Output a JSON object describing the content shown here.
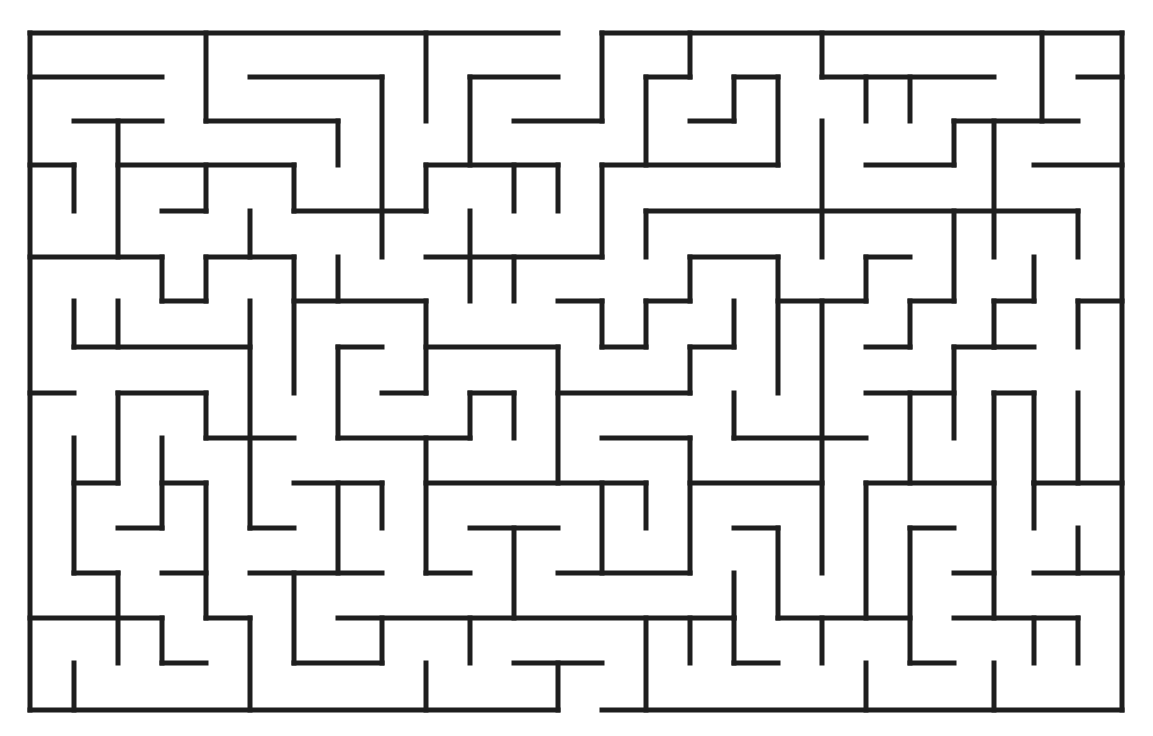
{
  "maze": {
    "title": "",
    "wall_color": "#1e1e1e",
    "background": "#ffffff",
    "entrance": {
      "x1": 558,
      "y1": 33,
      "x2": 602,
      "y2": 33
    },
    "exit": {
      "x1": 558,
      "y1": 710,
      "x2": 602,
      "y2": 710
    },
    "segments": [
      [
        30,
        33,
        558,
        33
      ],
      [
        602,
        33,
        1122,
        33
      ],
      [
        30,
        33,
        30,
        710
      ],
      [
        1122,
        33,
        1122,
        710
      ],
      [
        30,
        710,
        558,
        710
      ],
      [
        602,
        710,
        1122,
        710
      ],
      [
        30,
        77,
        162,
        77
      ],
      [
        206,
        33,
        206,
        121
      ],
      [
        206,
        121,
        338,
        121
      ],
      [
        338,
        121,
        338,
        165
      ],
      [
        250,
        77,
        382,
        77
      ],
      [
        382,
        77,
        382,
        257
      ],
      [
        426,
        33,
        426,
        121
      ],
      [
        470,
        77,
        558,
        77
      ],
      [
        470,
        77,
        470,
        165
      ],
      [
        514,
        121,
        602,
        121
      ],
      [
        602,
        33,
        602,
        121
      ],
      [
        646,
        77,
        690,
        77
      ],
      [
        690,
        33,
        690,
        77
      ],
      [
        646,
        77,
        646,
        165
      ],
      [
        734,
        77,
        778,
        77
      ],
      [
        734,
        77,
        734,
        121
      ],
      [
        690,
        121,
        734,
        121
      ],
      [
        778,
        77,
        778,
        165
      ],
      [
        602,
        165,
        778,
        165
      ],
      [
        822,
        33,
        822,
        77
      ],
      [
        822,
        77,
        994,
        77
      ],
      [
        866,
        77,
        866,
        121
      ],
      [
        910,
        77,
        910,
        121
      ],
      [
        1042,
        33,
        1042,
        121
      ],
      [
        1078,
        77,
        1122,
        77
      ],
      [
        74,
        121,
        162,
        121
      ],
      [
        118,
        121,
        118,
        257
      ],
      [
        118,
        165,
        294,
        165
      ],
      [
        294,
        165,
        294,
        211
      ],
      [
        294,
        211,
        426,
        211
      ],
      [
        30,
        165,
        74,
        165
      ],
      [
        74,
        165,
        74,
        211
      ],
      [
        162,
        211,
        206,
        211
      ],
      [
        206,
        165,
        206,
        211
      ],
      [
        250,
        211,
        250,
        257
      ],
      [
        426,
        165,
        558,
        165
      ],
      [
        426,
        165,
        426,
        211
      ],
      [
        514,
        165,
        514,
        211
      ],
      [
        558,
        165,
        558,
        211
      ],
      [
        470,
        211,
        470,
        301
      ],
      [
        426,
        257,
        602,
        257
      ],
      [
        514,
        257,
        514,
        301
      ],
      [
        602,
        165,
        602,
        257
      ],
      [
        646,
        211,
        1078,
        211
      ],
      [
        646,
        211,
        646,
        257
      ],
      [
        822,
        121,
        822,
        257
      ],
      [
        866,
        165,
        954,
        165
      ],
      [
        954,
        121,
        954,
        165
      ],
      [
        954,
        121,
        1078,
        121
      ],
      [
        994,
        121,
        994,
        257
      ],
      [
        1034,
        165,
        1122,
        165
      ],
      [
        1078,
        211,
        1078,
        257
      ],
      [
        30,
        257,
        162,
        257
      ],
      [
        162,
        257,
        162,
        301
      ],
      [
        162,
        301,
        206,
        301
      ],
      [
        206,
        257,
        206,
        301
      ],
      [
        206,
        257,
        294,
        257
      ],
      [
        294,
        257,
        294,
        393
      ],
      [
        338,
        257,
        338,
        301
      ],
      [
        294,
        301,
        426,
        301
      ],
      [
        426,
        301,
        426,
        393
      ],
      [
        382,
        393,
        426,
        393
      ],
      [
        338,
        347,
        382,
        347
      ],
      [
        338,
        347,
        338,
        438
      ],
      [
        338,
        438,
        470,
        438
      ],
      [
        74,
        301,
        74,
        347
      ],
      [
        118,
        301,
        118,
        347
      ],
      [
        74,
        347,
        250,
        347
      ],
      [
        250,
        301,
        250,
        528
      ],
      [
        30,
        393,
        74,
        393
      ],
      [
        558,
        301,
        602,
        301
      ],
      [
        602,
        301,
        602,
        347
      ],
      [
        602,
        347,
        646,
        347
      ],
      [
        646,
        301,
        646,
        347
      ],
      [
        646,
        301,
        690,
        301
      ],
      [
        690,
        257,
        690,
        301
      ],
      [
        690,
        257,
        778,
        257
      ],
      [
        778,
        257,
        778,
        393
      ],
      [
        734,
        301,
        734,
        347
      ],
      [
        690,
        347,
        734,
        347
      ],
      [
        690,
        347,
        690,
        393
      ],
      [
        558,
        393,
        690,
        393
      ],
      [
        778,
        301,
        866,
        301
      ],
      [
        866,
        257,
        866,
        301
      ],
      [
        866,
        257,
        910,
        257
      ],
      [
        822,
        301,
        822,
        573
      ],
      [
        910,
        301,
        954,
        301
      ],
      [
        954,
        211,
        954,
        301
      ],
      [
        910,
        301,
        910,
        347
      ],
      [
        866,
        347,
        910,
        347
      ],
      [
        1034,
        257,
        1034,
        301
      ],
      [
        994,
        301,
        1034,
        301
      ],
      [
        994,
        301,
        994,
        347
      ],
      [
        994,
        347,
        1034,
        347
      ],
      [
        1078,
        301,
        1122,
        301
      ],
      [
        1078,
        301,
        1078,
        347
      ],
      [
        954,
        347,
        994,
        347
      ],
      [
        954,
        347,
        954,
        438
      ],
      [
        866,
        393,
        954,
        393
      ],
      [
        910,
        393,
        910,
        483
      ],
      [
        994,
        393,
        1034,
        393
      ],
      [
        994,
        393,
        994,
        618
      ],
      [
        1034,
        393,
        1034,
        483
      ],
      [
        1078,
        393,
        1078,
        483
      ],
      [
        1034,
        483,
        1122,
        483
      ],
      [
        426,
        347,
        558,
        347
      ],
      [
        558,
        347,
        558,
        483
      ],
      [
        470,
        393,
        514,
        393
      ],
      [
        470,
        393,
        470,
        438
      ],
      [
        514,
        393,
        514,
        438
      ],
      [
        426,
        438,
        426,
        573
      ],
      [
        426,
        483,
        646,
        483
      ],
      [
        602,
        438,
        690,
        438
      ],
      [
        690,
        438,
        690,
        573
      ],
      [
        646,
        483,
        646,
        528
      ],
      [
        602,
        483,
        602,
        573
      ],
      [
        558,
        573,
        690,
        573
      ],
      [
        734,
        393,
        734,
        438
      ],
      [
        734,
        438,
        866,
        438
      ],
      [
        690,
        483,
        822,
        483
      ],
      [
        734,
        528,
        778,
        528
      ],
      [
        778,
        528,
        778,
        618
      ],
      [
        118,
        393,
        206,
        393
      ],
      [
        118,
        393,
        118,
        483
      ],
      [
        206,
        393,
        206,
        438
      ],
      [
        206,
        438,
        294,
        438
      ],
      [
        74,
        438,
        74,
        573
      ],
      [
        74,
        483,
        118,
        483
      ],
      [
        162,
        438,
        162,
        528
      ],
      [
        162,
        483,
        206,
        483
      ],
      [
        206,
        483,
        206,
        618
      ],
      [
        118,
        528,
        162,
        528
      ],
      [
        74,
        573,
        118,
        573
      ],
      [
        118,
        573,
        118,
        663
      ],
      [
        162,
        573,
        206,
        573
      ],
      [
        250,
        528,
        294,
        528
      ],
      [
        294,
        483,
        382,
        483
      ],
      [
        382,
        483,
        382,
        528
      ],
      [
        338,
        483,
        338,
        573
      ],
      [
        250,
        573,
        382,
        573
      ],
      [
        294,
        573,
        294,
        663
      ],
      [
        294,
        663,
        382,
        663
      ],
      [
        382,
        618,
        382,
        663
      ],
      [
        338,
        618,
        734,
        618
      ],
      [
        470,
        528,
        558,
        528
      ],
      [
        514,
        528,
        514,
        618
      ],
      [
        426,
        573,
        470,
        573
      ],
      [
        734,
        573,
        734,
        618
      ],
      [
        866,
        483,
        994,
        483
      ],
      [
        866,
        483,
        866,
        618
      ],
      [
        910,
        528,
        954,
        528
      ],
      [
        910,
        528,
        910,
        663
      ],
      [
        910,
        663,
        954,
        663
      ],
      [
        954,
        573,
        994,
        573
      ],
      [
        1034,
        483,
        1034,
        528
      ],
      [
        1078,
        528,
        1078,
        573
      ],
      [
        1034,
        573,
        1122,
        573
      ],
      [
        954,
        618,
        1078,
        618
      ],
      [
        1078,
        618,
        1078,
        663
      ],
      [
        1034,
        618,
        1034,
        663
      ],
      [
        30,
        618,
        162,
        618
      ],
      [
        162,
        618,
        162,
        663
      ],
      [
        162,
        663,
        206,
        663
      ],
      [
        206,
        618,
        250,
        618
      ],
      [
        250,
        618,
        250,
        710
      ],
      [
        74,
        663,
        74,
        710
      ],
      [
        426,
        663,
        426,
        710
      ],
      [
        470,
        618,
        470,
        663
      ],
      [
        514,
        663,
        602,
        663
      ],
      [
        558,
        663,
        558,
        710
      ],
      [
        646,
        618,
        646,
        710
      ],
      [
        690,
        618,
        690,
        663
      ],
      [
        734,
        663,
        778,
        663
      ],
      [
        734,
        618,
        734,
        663
      ],
      [
        778,
        618,
        910,
        618
      ],
      [
        822,
        618,
        822,
        663
      ],
      [
        866,
        663,
        866,
        710
      ],
      [
        994,
        663,
        994,
        710
      ]
    ]
  }
}
